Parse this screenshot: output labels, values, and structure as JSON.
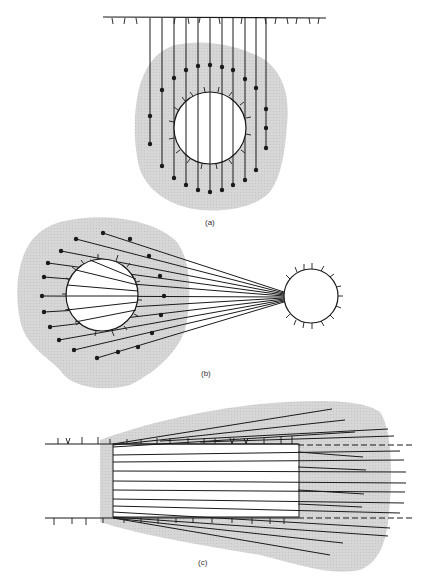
{
  "figure": {
    "panels": [
      {
        "id": "a",
        "label": "(a)",
        "label_x": 205,
        "label_y": 218
      },
      {
        "id": "b",
        "label": "(b)",
        "label_x": 201,
        "label_y": 369
      },
      {
        "id": "c",
        "label": "(c)",
        "label_x": 198,
        "label_y": 558
      }
    ]
  },
  "colors": {
    "shade": "#d4d4d4",
    "line": "#1a1a1a",
    "background": "#ffffff"
  }
}
